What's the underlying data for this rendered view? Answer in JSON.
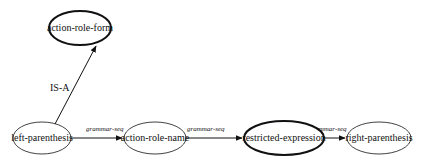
{
  "diagram": {
    "nodes": [
      {
        "id": "action-role-form",
        "label": "action-role-form",
        "cx": 80,
        "cy": 28,
        "rx": 31,
        "ry": 17,
        "bold": true
      },
      {
        "id": "left-parenthesis",
        "label": "left-parenthesis",
        "cx": 42,
        "cy": 138,
        "rx": 29,
        "ry": 16,
        "bold": false
      },
      {
        "id": "action-role-name",
        "label": "action-role-name",
        "cx": 155,
        "cy": 138,
        "rx": 31,
        "ry": 16,
        "bold": false
      },
      {
        "id": "restricted-expression",
        "label": "restricted-expression",
        "cx": 284,
        "cy": 138,
        "rx": 40,
        "ry": 17,
        "bold": true
      },
      {
        "id": "right-parenthesis",
        "label": "right-parenthesis",
        "cx": 379,
        "cy": 138,
        "rx": 32,
        "ry": 16,
        "bold": false
      }
    ],
    "edges": [
      {
        "from": "left-parenthesis",
        "to": "action-role-form",
        "label": "IS-A",
        "style": "isa"
      },
      {
        "from": "left-parenthesis",
        "to": "action-role-name",
        "label": "grammar-seq",
        "style": "seq"
      },
      {
        "from": "action-role-name",
        "to": "restricted-expression",
        "label": "grammar-seq",
        "style": "seq"
      },
      {
        "from": "restricted-expression",
        "to": "right-parenthesis",
        "label": "grammar-seq",
        "style": "seq"
      }
    ]
  },
  "labels": {
    "node_action_role_form": "action-role-form",
    "node_left_parenthesis": "left-parenthesis",
    "node_action_role_name": "action-role-name",
    "node_restricted_expression": "restricted-expression",
    "node_right_parenthesis": "right-parenthesis",
    "edge_isa": "IS-A",
    "edge_seq_1": "grammar-seq",
    "edge_seq_2": "grammar-seq",
    "edge_seq_3": "grammar-seq"
  },
  "colors": {
    "stroke": "#111111",
    "background": "#ffffff"
  }
}
